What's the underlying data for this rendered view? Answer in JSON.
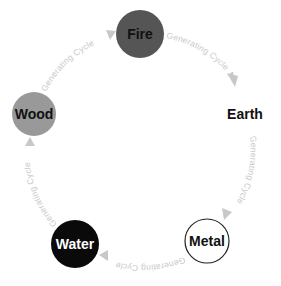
{
  "diagram": {
    "type": "cycle",
    "nodes": [
      {
        "id": "fire",
        "label": "Fire",
        "cx": 140,
        "cy": 34,
        "r": 24,
        "fill": "#555555",
        "stroke": "none",
        "text_color": "#111111"
      },
      {
        "id": "earth",
        "label": "Earth",
        "cx": 245,
        "cy": 114,
        "r": 24,
        "fill": "#ffffff",
        "stroke": "none",
        "text_color": "#111111"
      },
      {
        "id": "metal",
        "label": "Metal",
        "cx": 207,
        "cy": 241,
        "r": 22,
        "fill": "#ffffff",
        "stroke": "#222222",
        "text_color": "#111111"
      },
      {
        "id": "water",
        "label": "Water",
        "cx": 75,
        "cy": 244,
        "r": 24,
        "fill": "#0a0a0a",
        "stroke": "none",
        "text_color": "#ffffff"
      },
      {
        "id": "wood",
        "label": "Wood",
        "cx": 34,
        "cy": 114,
        "r": 22,
        "fill": "#999999",
        "stroke": "none",
        "text_color": "#111111"
      }
    ],
    "edges": [
      {
        "from": "fire",
        "to": "earth",
        "label": "Generating Cycle"
      },
      {
        "from": "earth",
        "to": "metal",
        "label": "Generating Cycle"
      },
      {
        "from": "metal",
        "to": "water",
        "label": "Generating Cycle"
      },
      {
        "from": "water",
        "to": "wood",
        "label": "Generating Cycle"
      },
      {
        "from": "wood",
        "to": "fire",
        "label": "Generating Cycle"
      }
    ],
    "edge_color": "#c8c8c8"
  }
}
